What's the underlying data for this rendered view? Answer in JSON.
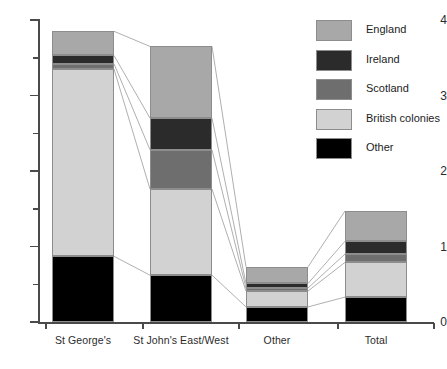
{
  "chart_data": {
    "type": "bar",
    "stacked": true,
    "title": "",
    "xlabel": "",
    "ylabel": "",
    "ylim": [
      0,
      4
    ],
    "y_major_ticks": [
      0,
      1,
      2,
      3,
      4
    ],
    "y_minor_ticks": [
      0.5,
      1.5,
      2.5,
      3.5
    ],
    "y_tick_labels": [
      "0",
      "1",
      "2",
      "3",
      "4"
    ],
    "grid": false,
    "legend_position": "top-right",
    "categories": [
      "St George's",
      "St John's East/West",
      "Other",
      "Total"
    ],
    "series": [
      {
        "name": "Other",
        "color": "#000000",
        "values": [
          0.87,
          0.62,
          0.2,
          0.33
        ]
      },
      {
        "name": "British colonies",
        "color": "#d2d2d2",
        "values": [
          2.48,
          1.14,
          0.21,
          0.46
        ]
      },
      {
        "name": "Scotland",
        "color": "#6e6e6e",
        "values": [
          0.07,
          0.52,
          0.04,
          0.11
        ]
      },
      {
        "name": "Ireland",
        "color": "#2b2b2b",
        "values": [
          0.11,
          0.42,
          0.06,
          0.17
        ]
      },
      {
        "name": "England",
        "color": "#a8a8a8",
        "values": [
          0.32,
          0.95,
          0.22,
          0.4
        ]
      }
    ],
    "totals": [
      3.85,
      3.65,
      0.73,
      1.47
    ]
  },
  "legend": {
    "items": [
      {
        "label": "England",
        "color": "#a8a8a8"
      },
      {
        "label": "Ireland",
        "color": "#2b2b2b"
      },
      {
        "label": "Scotland",
        "color": "#6e6e6e"
      },
      {
        "label": "British colonies",
        "color": "#d2d2d2"
      },
      {
        "label": "Other",
        "color": "#000000"
      }
    ]
  },
  "axes": {
    "y_labels": [
      "4",
      "3",
      "2",
      "1",
      "0"
    ],
    "x_labels": [
      "St George's",
      "St John's East/West",
      "Other",
      "Total"
    ]
  },
  "colors": {
    "axis": "#4a4a4a",
    "text": "#2b2b2b",
    "connector": "#8d8d8d",
    "background": "#ffffff"
  }
}
